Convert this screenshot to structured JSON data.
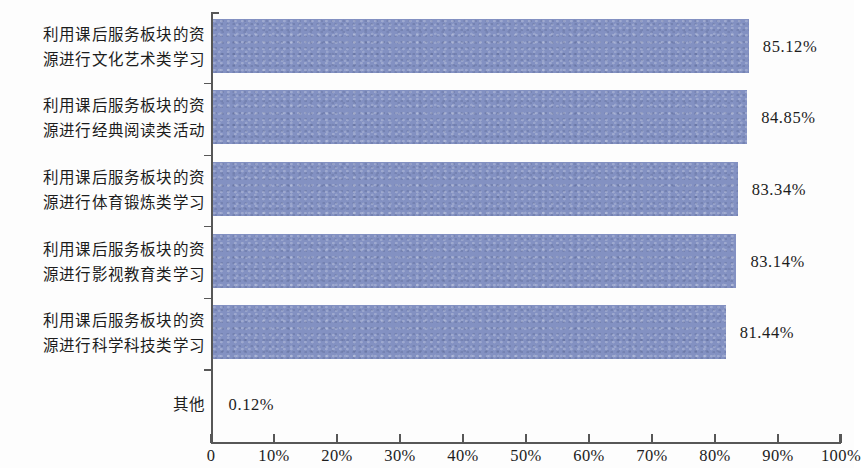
{
  "chart_data": {
    "type": "bar",
    "orientation": "horizontal",
    "title": "",
    "subtitle": "",
    "xlabel": "",
    "ylabel": "",
    "xlim": [
      0,
      100
    ],
    "grid": false,
    "legend": false,
    "bar_color": "#8391c2",
    "axis_color": "#575757",
    "categories": [
      "利用课后服务板块的资\n源进行文化艺术类学习",
      "利用课后服务板块的资\n源进行经典阅读类活动",
      "利用课后服务板块的资\n源进行体育锻炼类学习",
      "利用课后服务板块的资\n源进行影视教育类学习",
      "利用课后服务板块的资\n源进行科学科技类学习",
      "其他"
    ],
    "values": [
      85.12,
      84.85,
      83.34,
      83.14,
      81.44,
      0.12
    ],
    "value_labels": [
      "85.12%",
      "84.85%",
      "83.34%",
      "83.14%",
      "81.44%",
      "0.12%"
    ],
    "xticks": [
      0,
      10,
      20,
      30,
      40,
      50,
      60,
      70,
      80,
      90,
      100
    ],
    "xtick_labels": [
      "0",
      "10%",
      "20%",
      "30%",
      "40%",
      "50%",
      "60%",
      "70%",
      "80%",
      "90%",
      "100%"
    ]
  }
}
